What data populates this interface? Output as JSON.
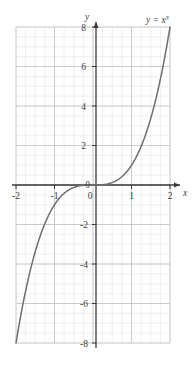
{
  "chart_data": {
    "type": "line",
    "title": "",
    "subtitle": "",
    "function_label": "y = x",
    "function_exponent": "3",
    "expression": "y = x^3",
    "xlabel": "x",
    "ylabel": "y",
    "xlim": [
      -2,
      2
    ],
    "ylim": [
      -8,
      8
    ],
    "x_ticks": [
      -2,
      -1,
      0,
      1,
      2
    ],
    "x_tick_labels": [
      "-2",
      "-1",
      "0",
      "1",
      "2"
    ],
    "y_ticks": [
      8,
      6,
      4,
      2,
      0,
      -2,
      -4,
      -6,
      -8
    ],
    "y_tick_labels": [
      "8",
      "6",
      "4",
      "2",
      "0",
      "-2",
      "-4",
      "-6",
      "-8"
    ],
    "grid": true,
    "grid_major_x_step": 1,
    "grid_major_y_step": 2,
    "grid_minor_x_step": 0.25,
    "grid_minor_y_step": 0.5,
    "legend": "none",
    "axis_arrows": [
      "x-positive",
      "y-positive"
    ],
    "x": [
      -2,
      -1.9,
      -1.8,
      -1.7,
      -1.6,
      -1.5,
      -1.4,
      -1.3,
      -1.2,
      -1.1,
      -1,
      -0.9,
      -0.8,
      -0.7,
      -0.6,
      -0.5,
      -0.4,
      -0.3,
      -0.2,
      -0.1,
      0,
      0.1,
      0.2,
      0.3,
      0.4,
      0.5,
      0.6,
      0.7,
      0.8,
      0.9,
      1,
      1.1,
      1.2,
      1.3,
      1.4,
      1.5,
      1.6,
      1.7,
      1.8,
      1.9,
      2
    ],
    "values": [
      -8,
      -6.859,
      -5.832,
      -4.913,
      -4.096,
      -3.375,
      -2.744,
      -2.197,
      -1.728,
      -1.331,
      -1,
      -0.729,
      -0.512,
      -0.343,
      -0.216,
      -0.125,
      -0.064,
      -0.027,
      -0.008,
      -0.001,
      0,
      0.001,
      0.008,
      0.027,
      0.064,
      0.125,
      0.216,
      0.343,
      0.512,
      0.729,
      1,
      1.331,
      1.728,
      2.197,
      2.744,
      3.375,
      4.096,
      4.913,
      5.832,
      6.859,
      8
    ],
    "series": [
      {
        "name": "y = x^3",
        "values": [
          -8,
          -6.859,
          -5.832,
          -4.913,
          -4.096,
          -3.375,
          -2.744,
          -2.197,
          -1.728,
          -1.331,
          -1,
          -0.729,
          -0.512,
          -0.343,
          -0.216,
          -0.125,
          -0.064,
          -0.027,
          -0.008,
          -0.001,
          0,
          0.001,
          0.008,
          0.027,
          0.064,
          0.125,
          0.216,
          0.343,
          0.512,
          0.729,
          1,
          1.331,
          1.728,
          2.197,
          2.744,
          3.375,
          4.096,
          4.913,
          5.832,
          6.859,
          8
        ]
      }
    ],
    "colors": {
      "curve": "#6e6e6e",
      "axis": "#3a3a3a",
      "grid_major": "#c8c8c8",
      "grid_minor": "#e2e2e2",
      "text": "#3c3c3c",
      "background": "#ffffff"
    }
  }
}
